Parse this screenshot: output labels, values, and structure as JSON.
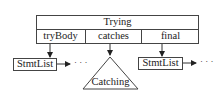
{
  "diagram": {
    "root": {
      "label": "Trying",
      "fields": [
        {
          "label": "tryBody"
        },
        {
          "label": "catches"
        },
        {
          "label": "final"
        }
      ]
    },
    "children": [
      {
        "label": "StmtList",
        "shape": "box",
        "continuation": "· · ·"
      },
      {
        "label": "Catching",
        "shape": "triangle"
      },
      {
        "label": "StmtList",
        "shape": "box",
        "continuation": "· · ·"
      }
    ],
    "colors": {
      "stroke": "#444444",
      "background": "#ffffff",
      "text": "#222222"
    }
  }
}
